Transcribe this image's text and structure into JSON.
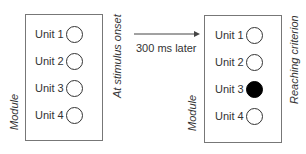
{
  "left_module": {
    "module_label": "Module",
    "state_label": "At stimulus onset",
    "units": [
      {
        "label": "Unit 1",
        "active": false
      },
      {
        "label": "Unit 2",
        "active": false
      },
      {
        "label": "Unit 3",
        "active": false
      },
      {
        "label": "Unit 4",
        "active": false
      }
    ]
  },
  "transition": {
    "label": "300 ms later"
  },
  "right_module": {
    "module_label": "Module",
    "state_label": "Reaching criterion",
    "units": [
      {
        "label": "Unit 1",
        "active": false
      },
      {
        "label": "Unit 2",
        "active": false
      },
      {
        "label": "Unit 3",
        "active": true
      },
      {
        "label": "Unit 4",
        "active": false
      }
    ]
  }
}
